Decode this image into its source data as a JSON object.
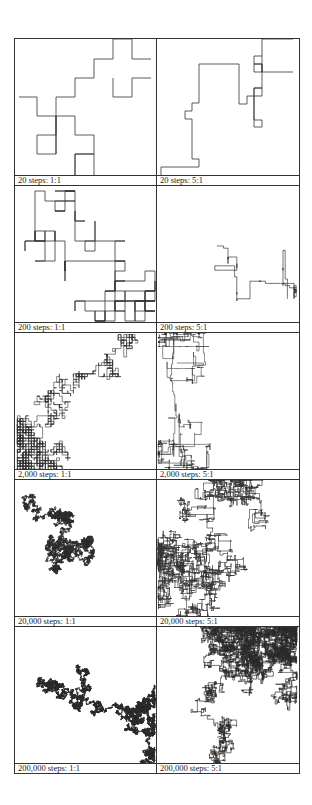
{
  "figure": {
    "line_color": "#333333",
    "rows": [
      {
        "panels": [
          {
            "label": "20 steps: 1:1",
            "steps": 20,
            "aspect": "1:1",
            "path": [
              [
                4,
                58
              ],
              [
                22,
                58
              ],
              [
                22,
                77
              ],
              [
                41,
                77
              ],
              [
                41,
                96
              ],
              [
                22,
                96
              ],
              [
                22,
                115
              ],
              [
                41,
                115
              ],
              [
                41,
                77
              ],
              [
                60,
                77
              ],
              [
                60,
                96
              ],
              [
                79,
                96
              ],
              [
                79,
                115
              ],
              [
                60,
                115
              ],
              [
                60,
                136
              ],
              [
                60,
                115
              ],
              [
                79,
                115
              ],
              [
                79,
                136
              ]
            ],
            "path2": [
              [
                41,
                115
              ],
              [
                41,
                58
              ],
              [
                60,
                58
              ],
              [
                60,
                39
              ],
              [
                79,
                39
              ],
              [
                79,
                20
              ],
              [
                98,
                20
              ],
              [
                98,
                0
              ],
              [
                117,
                0
              ],
              [
                117,
                20
              ],
              [
                136,
                20
              ]
            ],
            "path3": [
              [
                98,
                39
              ],
              [
                98,
                58
              ],
              [
                117,
                58
              ],
              [
                117,
                39
              ],
              [
                136,
                39
              ]
            ],
            "stroke": 0.8
          },
          {
            "label": "20 steps: 5:1",
            "steps": 20,
            "aspect": "5:1",
            "path": [
              [
                4,
                136
              ],
              [
                4,
                128
              ],
              [
                42,
                128
              ],
              [
                42,
                120
              ],
              [
                35,
                120
              ],
              [
                35,
                80
              ],
              [
                28,
                80
              ],
              [
                28,
                72
              ],
              [
                35,
                72
              ],
              [
                35,
                64
              ],
              [
                42,
                64
              ],
              [
                42,
                25
              ],
              [
                82,
                25
              ],
              [
                82,
                65
              ],
              [
                90,
                65
              ],
              [
                90,
                57
              ],
              [
                97,
                57
              ],
              [
                97,
                49
              ],
              [
                105,
                49
              ],
              [
                105,
                0
              ],
              [
                136,
                0
              ]
            ],
            "path2": [
              [
                105,
                17
              ],
              [
                97,
                17
              ],
              [
                97,
                25
              ],
              [
                105,
                25
              ],
              [
                105,
                33
              ],
              [
                97,
                33
              ],
              [
                97,
                25
              ],
              [
                105,
                25
              ],
              [
                105,
                33
              ],
              [
                136,
                33
              ]
            ],
            "path3": [
              [
                97,
                57
              ],
              [
                97,
                88
              ],
              [
                105,
                88
              ],
              [
                105,
                81
              ],
              [
                97,
                81
              ],
              [
                97,
                49
              ],
              [
                105,
                49
              ],
              [
                105,
                57
              ],
              [
                97,
                57
              ]
            ],
            "stroke": 0.8
          }
        ]
      },
      {
        "panels": [
          {
            "label": "200 steps: 1:1",
            "steps": 200,
            "aspect": "1:1",
            "seed": 11,
            "grid": 10,
            "center": [
              70,
              75
            ],
            "bias": [
              0.15,
              -0.05
            ],
            "stroke": 0.8
          },
          {
            "label": "200 steps: 5:1",
            "steps": 200,
            "aspect": "5:1",
            "seed": 29,
            "grid": 2.2,
            "center": [
              60,
              60
            ],
            "bias": [
              0.3,
              0.25
            ],
            "stroke": 0.7
          }
        ]
      },
      {
        "panels": [
          {
            "label": "2,000 steps: 1:1",
            "steps": 2000,
            "aspect": "1:1",
            "seed": 7,
            "grid": 2.8,
            "center": [
              120,
              10
            ],
            "bias": [
              -0.28,
              0.32
            ],
            "stroke": 0.6
          },
          {
            "label": "2,000 steps: 5:1",
            "steps": 2000,
            "aspect": "5:1",
            "seed": 53,
            "grid": 1.1,
            "center": [
              20,
              30
            ],
            "bias": [
              0.18,
              0.12
            ],
            "stroke": 0.6
          }
        ]
      },
      {
        "panels": [
          {
            "label": "20,000 steps: 1:1",
            "steps": 20000,
            "aspect": "1:1",
            "seed": 101,
            "grid": 0.55,
            "center": [
              20,
              15
            ],
            "bias": [
              0.05,
              0.05
            ],
            "stroke": 0.7
          },
          {
            "label": "20,000 steps: 5:1",
            "steps": 20000,
            "aspect": "5:1",
            "seed": 211,
            "grid": 0.5,
            "center": [
              70,
              80
            ],
            "bias": [
              0,
              0
            ],
            "stroke": 0.7
          }
        ]
      },
      {
        "panels": [
          {
            "label": "200,000 steps: 1:1",
            "steps": 200000,
            "aspect": "1:1",
            "seed": 307,
            "grid": 0.17,
            "center": [
              40,
              60
            ],
            "bias": [
              0.02,
              0.02
            ],
            "stroke": 0.8
          },
          {
            "label": "200,000 steps: 5:1",
            "steps": 200000,
            "aspect": "5:1",
            "seed": 401,
            "grid": 0.16,
            "center": [
              60,
              110
            ],
            "bias": [
              0.02,
              -0.03
            ],
            "stroke": 0.8
          }
        ]
      }
    ]
  }
}
